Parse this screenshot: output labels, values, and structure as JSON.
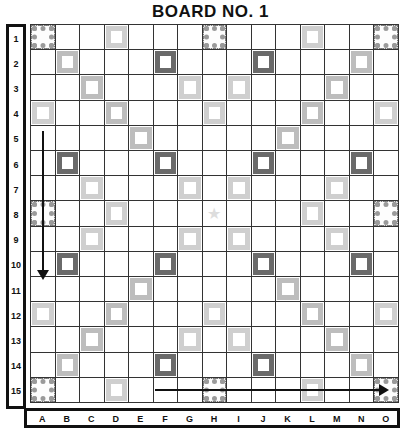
{
  "title": "BOARD NO. 1",
  "rows": [
    "1",
    "2",
    "3",
    "4",
    "5",
    "6",
    "7",
    "8",
    "9",
    "10",
    "11",
    "12",
    "13",
    "14",
    "15"
  ],
  "columns": [
    "A",
    "B",
    "C",
    "D",
    "E",
    "F",
    "G",
    "H",
    "I",
    "J",
    "K",
    "L",
    "M",
    "N",
    "O"
  ],
  "premium_squares": {
    "tw": [
      "A1",
      "H1",
      "O1",
      "A8",
      "O8",
      "A15",
      "H15",
      "O15"
    ],
    "dw": [
      "B2",
      "N2",
      "C3",
      "M3",
      "D4",
      "L4",
      "E5",
      "K5",
      "E11",
      "K11",
      "D12",
      "L12",
      "C13",
      "M13",
      "B14",
      "N14"
    ],
    "tl": [
      "F2",
      "J2",
      "B6",
      "F6",
      "J6",
      "N6",
      "B10",
      "F10",
      "J10",
      "N10",
      "F14",
      "J14"
    ],
    "dl": [
      "D1",
      "L1",
      "G3",
      "I3",
      "A4",
      "H4",
      "O4",
      "C7",
      "G7",
      "I7",
      "M7",
      "D8",
      "L8",
      "C9",
      "G9",
      "I9",
      "M9",
      "A12",
      "H12",
      "O12",
      "G13",
      "I13",
      "D15",
      "L15"
    ],
    "star": "H8"
  },
  "arrows": [
    {
      "direction": "down",
      "column": "A",
      "from_row": "5",
      "to_row": "11"
    },
    {
      "direction": "right",
      "row": "15",
      "from_col": "F",
      "to_col": "K"
    }
  ]
}
